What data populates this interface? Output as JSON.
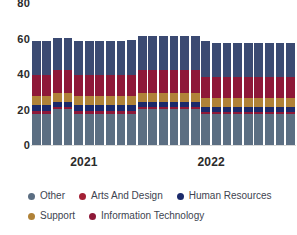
{
  "chart_data": {
    "type": "bar",
    "stacked": true,
    "title": "",
    "xlabel": "",
    "ylabel": "",
    "ylim": [
      0,
      80
    ],
    "yticks": [
      0,
      20,
      40,
      60,
      80
    ],
    "grid": false,
    "legend_position": "bottom",
    "x_group_labels": [
      "2021",
      "2022"
    ],
    "categories": [
      "2021-01",
      "2021-02",
      "2021-03",
      "2021-04",
      "2021-05",
      "2021-06",
      "2021-07",
      "2021-08",
      "2021-09",
      "2021-10",
      "2021-11",
      "2021-12",
      "2022-01",
      "2022-02",
      "2022-03",
      "2022-04",
      "2022-05",
      "2022-06",
      "2022-07",
      "2022-08",
      "2022-09",
      "2022-10",
      "2022-11",
      "2022-12",
      "2023-01"
    ],
    "series": [
      {
        "name": "Other",
        "color": "#5b6e82",
        "values": [
          18,
          18,
          21,
          21,
          18,
          18,
          18,
          18,
          18,
          18,
          21,
          21,
          21,
          21,
          21,
          21,
          18,
          18,
          18,
          18,
          18,
          18,
          18,
          18,
          18
        ]
      },
      {
        "name": "Information Technology",
        "color": "#8e1838",
        "values": [
          2,
          2,
          1,
          1,
          2,
          2,
          2,
          2,
          2,
          2,
          1,
          1,
          1,
          1,
          1,
          1,
          1,
          1,
          1,
          1,
          1,
          1,
          1,
          1,
          1
        ]
      },
      {
        "name": "Human Resources",
        "color": "#1b2a6b",
        "values": [
          3,
          3,
          3,
          3,
          3,
          3,
          3,
          3,
          3,
          3,
          3,
          3,
          3,
          3,
          3,
          3,
          3,
          3,
          3,
          3,
          3,
          3,
          3,
          3,
          3
        ]
      },
      {
        "name": "Support",
        "color": "#b08238",
        "values": [
          5,
          5,
          5,
          5,
          5,
          5,
          5,
          5,
          5,
          5,
          5,
          5,
          5,
          5,
          5,
          5,
          5,
          5,
          5,
          5,
          5,
          5,
          5,
          5,
          5
        ]
      },
      {
        "name": "Arts And Design",
        "color": "#8e1838",
        "values": [
          12,
          12,
          13,
          13,
          12,
          12,
          12,
          12,
          12,
          12,
          13,
          13,
          13,
          13,
          13,
          13,
          12,
          12,
          12,
          12,
          12,
          12,
          12,
          12,
          12
        ]
      },
      {
        "name": "Other (top)",
        "color": "#3b4a72",
        "values": [
          19,
          19,
          18,
          18,
          19,
          19,
          19,
          19,
          19,
          20,
          19,
          19,
          19,
          19,
          19,
          19,
          20,
          19,
          19,
          19,
          19,
          19,
          19,
          19,
          19
        ]
      }
    ],
    "totals": [
      59,
      59,
      61,
      61,
      59,
      59,
      59,
      59,
      59,
      59.5,
      61,
      61,
      61,
      61,
      61,
      61,
      60,
      58,
      58,
      58,
      58,
      58,
      58,
      58,
      58
    ]
  },
  "y_axis": {
    "ticks": [
      "80",
      "60",
      "40",
      "20",
      "0"
    ]
  },
  "x_axis": {
    "groups": [
      {
        "label": "2021",
        "center_pct": 20
      },
      {
        "label": "2022",
        "center_pct": 68
      }
    ]
  },
  "legend": {
    "rows": [
      [
        {
          "label": "Other",
          "color": "#5b6e82",
          "name": "legend-item-other"
        },
        {
          "label": "Arts And Design",
          "color": "#a32035",
          "name": "legend-item-arts-and-design"
        },
        {
          "label": "Human Resources",
          "color": "#1b2a6b",
          "name": "legend-item-human-resources"
        }
      ],
      [
        {
          "label": "Support",
          "color": "#b08238",
          "name": "legend-item-support"
        },
        {
          "label": "Information Technology",
          "color": "#8e1838",
          "name": "legend-item-information-technology"
        }
      ]
    ]
  }
}
